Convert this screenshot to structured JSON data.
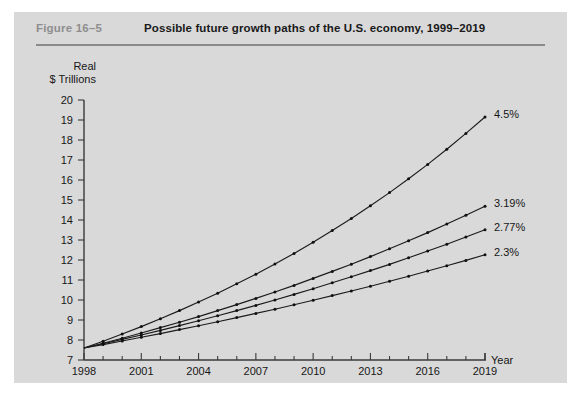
{
  "figure": {
    "number_label": "Figure  16–5",
    "title": "Possible future growth paths of the U.S. economy, 1999–2019"
  },
  "chart_data": {
    "type": "line",
    "title": "Possible future growth paths of the U.S. economy, 1999–2019",
    "subtitle": "",
    "xlabel": "Year",
    "ylabel": "Real $ Trillions",
    "ylabel_line1": "Real",
    "ylabel_line2": "$ Trillions",
    "xlim": [
      1998,
      2019
    ],
    "ylim": [
      7,
      20
    ],
    "ytick_step": 1,
    "grid": false,
    "legend_position": "right-end-of-line",
    "yticks": [
      7,
      8,
      9,
      10,
      11,
      12,
      13,
      14,
      15,
      16,
      17,
      18,
      19,
      20
    ],
    "ytick_labels": [
      "7",
      "8",
      "9",
      "10",
      "11",
      "12",
      "13",
      "14",
      "15",
      "16",
      "17",
      "18",
      "19",
      "20"
    ],
    "xticks": [
      1998,
      1999,
      2000,
      2001,
      2002,
      2003,
      2004,
      2005,
      2006,
      2007,
      2008,
      2009,
      2010,
      2011,
      2012,
      2013,
      2014,
      2015,
      2016,
      2017,
      2018,
      2019
    ],
    "xtick_labels_shown": [
      "1998",
      "2001",
      "2004",
      "2007",
      "2010",
      "2013",
      "2016",
      "2019"
    ],
    "xtick_labeled_years": [
      1998,
      2001,
      2004,
      2007,
      2010,
      2013,
      2016,
      2019
    ],
    "x": [
      1998,
      1999,
      2000,
      2001,
      2002,
      2003,
      2004,
      2005,
      2006,
      2007,
      2008,
      2009,
      2010,
      2011,
      2012,
      2013,
      2014,
      2015,
      2016,
      2017,
      2018,
      2019
    ],
    "series": [
      {
        "name": "4.5%",
        "label": "4.5%",
        "growth_rate_percent": 4.5,
        "values": [
          7.6,
          7.94,
          8.3,
          8.67,
          9.06,
          9.47,
          9.9,
          10.34,
          10.81,
          11.29,
          11.8,
          12.33,
          12.89,
          13.47,
          14.07,
          14.71,
          15.37,
          16.06,
          16.78,
          17.54,
          18.33,
          19.15
        ]
      },
      {
        "name": "3.19%",
        "label": "3.19%",
        "growth_rate_percent": 3.19,
        "values": [
          7.6,
          7.84,
          8.09,
          8.35,
          8.62,
          8.89,
          9.17,
          9.47,
          9.77,
          10.08,
          10.4,
          10.73,
          11.08,
          11.43,
          11.79,
          12.17,
          12.56,
          12.96,
          13.37,
          13.8,
          14.24,
          14.69
        ]
      },
      {
        "name": "2.77%",
        "label": "2.77%",
        "growth_rate_percent": 2.77,
        "values": [
          7.6,
          7.81,
          8.03,
          8.25,
          8.48,
          8.72,
          8.96,
          9.21,
          9.47,
          9.73,
          10.0,
          10.28,
          10.56,
          10.86,
          11.16,
          11.47,
          11.78,
          12.11,
          12.45,
          12.79,
          13.15,
          13.51
        ]
      },
      {
        "name": "2.3%",
        "label": "2.3%",
        "growth_rate_percent": 2.3,
        "values": [
          7.6,
          7.77,
          7.95,
          8.14,
          8.32,
          8.52,
          8.71,
          8.91,
          9.12,
          9.33,
          9.54,
          9.76,
          9.99,
          10.22,
          10.45,
          10.69,
          10.94,
          11.19,
          11.45,
          11.71,
          11.98,
          12.26
        ]
      }
    ],
    "colors": {
      "line": "#1b1b1b",
      "axis": "#3a3a3a",
      "text": "#161616",
      "figure_number": "#8e8e8e",
      "card_background": "#d9d9d9",
      "page_background": "#ffffff"
    }
  }
}
